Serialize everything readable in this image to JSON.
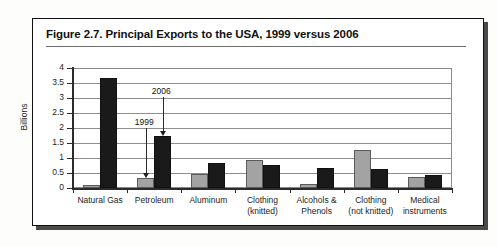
{
  "figure": {
    "title": "Figure 2.7.  Principal Exports to the USA, 1999 versus 2006"
  },
  "chart_data": {
    "type": "bar",
    "title": "Principal Exports to the USA, 1999 versus 2006",
    "xlabel": "",
    "ylabel": "Billions",
    "ylim": [
      0,
      4
    ],
    "yticks": [
      "0",
      "0.5",
      "1",
      "1.5",
      "2",
      "2.5",
      "3",
      "3.5",
      "4"
    ],
    "grid": true,
    "legend": "none",
    "categories": [
      "Natural Gas",
      "Petroleum",
      "Aluminum",
      "Clothing (knitted)",
      "Alcohols & Phenols",
      "Clothing (not knitted)",
      "Medical instruments"
    ],
    "category_lines": [
      [
        "Natural Gas"
      ],
      [
        "Petroleum"
      ],
      [
        "Aluminum"
      ],
      [
        "Clothing",
        "(knitted)"
      ],
      [
        "Alcohols &",
        "Phenols"
      ],
      [
        "Clothing",
        "(not knitted)"
      ],
      [
        "Medical",
        "instruments"
      ]
    ],
    "series": [
      {
        "name": "1999",
        "color": "#a3a3a3",
        "values": [
          0.1,
          0.32,
          0.46,
          0.95,
          0.12,
          1.28,
          0.38
        ]
      },
      {
        "name": "2006",
        "color": "#1a1a1a",
        "values": [
          3.68,
          1.75,
          0.84,
          0.78,
          0.67,
          0.65,
          0.45
        ]
      }
    ],
    "annotations": [
      {
        "label": "2006",
        "points_to": "Petroleum 2006 bar"
      },
      {
        "label": "1999",
        "points_to": "Petroleum 1999 bar"
      }
    ]
  }
}
